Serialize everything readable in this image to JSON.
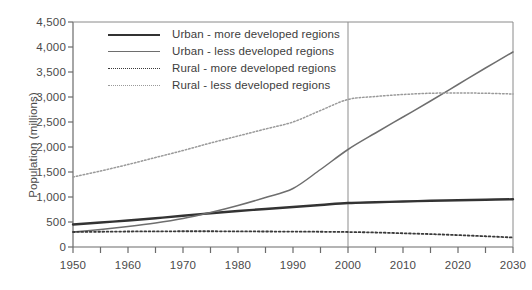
{
  "chart_data": {
    "type": "line",
    "title": "",
    "xlabel": "",
    "ylabel": "Population (millions)",
    "xlim": [
      1950,
      2030
    ],
    "ylim": [
      0,
      4500
    ],
    "grid": false,
    "legend_position": "top-left",
    "x_ticks": [
      1950,
      1960,
      1970,
      1980,
      1990,
      2000,
      2010,
      2020,
      2030
    ],
    "x_tick_labels": [
      "1950",
      "1960",
      "1970",
      "1980",
      "1990",
      "2000",
      "2010",
      "2020",
      "2030"
    ],
    "x_minor_ticks": [
      1955,
      1965,
      1975,
      1985,
      1995,
      2005,
      2015,
      2025
    ],
    "y_ticks": [
      0,
      500,
      1000,
      1500,
      2000,
      2500,
      3000,
      3500,
      4000,
      4500
    ],
    "y_tick_labels": [
      "0",
      "500",
      "1,000",
      "1,500",
      "2,000",
      "2,500",
      "3,000",
      "3,500",
      "4,000",
      "4,500"
    ],
    "annotations": [
      {
        "type": "vertical-reference-line",
        "x": 2000,
        "label": "2000"
      }
    ],
    "x": [
      1950,
      1955,
      1960,
      1965,
      1970,
      1975,
      1980,
      1985,
      1990,
      1995,
      2000,
      2005,
      2010,
      2015,
      2020,
      2025,
      2030
    ],
    "series": [
      {
        "name": "Urban - more developed regions",
        "style": "solid",
        "width": 2.4,
        "color": "#333333",
        "values": [
          450,
          490,
          530,
          575,
          625,
          675,
          720,
          760,
          800,
          840,
          880,
          895,
          910,
          925,
          935,
          945,
          955
        ]
      },
      {
        "name": "Urban - less developed regions",
        "style": "solid",
        "width": 1.5,
        "color": "#6e6e6e",
        "values": [
          300,
          350,
          410,
          480,
          570,
          690,
          830,
          990,
          1170,
          1550,
          1950,
          2280,
          2600,
          2920,
          3250,
          3580,
          3900
        ]
      },
      {
        "name": "Rural - more developed regions",
        "style": "dotted",
        "width": 1.8,
        "color": "#3a3a3a",
        "values": [
          300,
          305,
          310,
          312,
          315,
          315,
          312,
          310,
          308,
          305,
          300,
          290,
          275,
          258,
          238,
          215,
          190
        ]
      },
      {
        "name": "Rural - less developed regions",
        "style": "dotted",
        "width": 1.5,
        "color": "#9a9a9a",
        "values": [
          1400,
          1520,
          1650,
          1790,
          1930,
          2080,
          2220,
          2360,
          2500,
          2730,
          2950,
          3010,
          3050,
          3075,
          3080,
          3075,
          3060
        ]
      }
    ]
  }
}
